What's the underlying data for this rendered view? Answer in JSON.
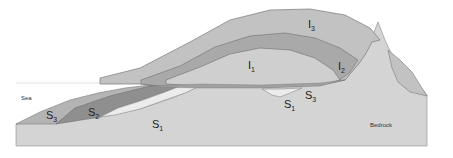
{
  "diagram": {
    "type": "geological cross-section (ice sheet over sediments and bedrock)",
    "colors": {
      "background": "#ffffff",
      "bedrock": "#d4d4d4",
      "ice_I1": "#cfcfcf",
      "ice_I2": "#a9a9a9",
      "ice_I3": "#c2c2c2",
      "sediment_S1": "#ececec",
      "sediment_S2": "#8f8f8f",
      "sediment_S3": "#b4b4b4",
      "outline": "#7a7a7a"
    },
    "labels": {
      "sea": "Sea",
      "bedrock": "Bedrock",
      "I1": {
        "letter": "I",
        "index": "1"
      },
      "I2": {
        "letter": "I",
        "index": "2"
      },
      "I3": {
        "letter": "I",
        "index": "3"
      },
      "S1_left": {
        "letter": "S",
        "index": "1"
      },
      "S1_right": {
        "letter": "S",
        "index": "1"
      },
      "S2": {
        "letter": "S",
        "index": "2"
      },
      "S3_left": {
        "letter": "S",
        "index": "3"
      },
      "S3_right": {
        "letter": "S",
        "index": "3"
      }
    }
  }
}
